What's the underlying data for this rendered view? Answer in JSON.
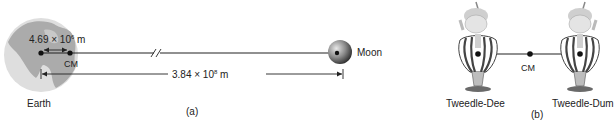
{
  "panel_a": {
    "earth_label": "Earth",
    "moon_label": "Moon",
    "cm_label": "CM",
    "earth_cm_distance": {
      "mantissa": "4.69 × 10",
      "exponent": "6",
      "unit": " m"
    },
    "earth_moon_distance": {
      "mantissa": "3.84 × 10",
      "exponent": "8",
      "unit": " m"
    },
    "panel_label": "(a)"
  },
  "panel_b": {
    "left_figure_label": "Tweedle-Dee",
    "right_figure_label": "Tweedle-Dum",
    "cm_label": "CM",
    "panel_label": "(b)"
  },
  "colors": {
    "earth_ocean": "#dcdcdc",
    "earth_land": "#a9a9a9",
    "line": "#222222",
    "moon_dark": "#3a3a3a",
    "moon_light": "#cfcfcf"
  }
}
